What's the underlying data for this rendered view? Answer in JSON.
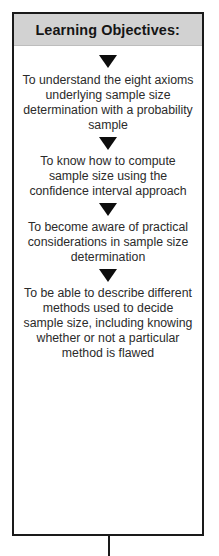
{
  "diagram": {
    "title": "Learning Objectives:",
    "header_bg": "#d2d2d2",
    "border_color": "#1a1a1a",
    "text_color": "#2b2b2b",
    "arrow_color": "#0d0d0d",
    "arrow_icon_name": "triangle-down-icon",
    "objectives": [
      {
        "index": 1,
        "text": "To understand the eight axioms underlying sample size determination with a probability sample"
      },
      {
        "index": 2,
        "text": "To know how to compute sample size using the confidence interval approach"
      },
      {
        "index": 3,
        "text": "To become aware of practical considerations in sample size determination"
      },
      {
        "index": 4,
        "text": "To be able to describe different methods used to decide sample size, including knowing whether or not a particular method is flawed"
      }
    ]
  }
}
